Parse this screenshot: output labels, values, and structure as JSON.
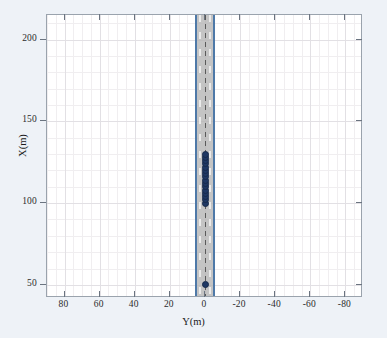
{
  "chart_data": {
    "type": "scatter",
    "title": "",
    "xlabel": "Y(m)",
    "ylabel": "X(m)",
    "xlim": [
      90,
      -90
    ],
    "ylim": [
      42,
      215
    ],
    "x_ticks": [
      80,
      60,
      40,
      20,
      0,
      -20,
      -40,
      -60,
      -80
    ],
    "x_tick_labels": [
      "80",
      "60",
      "40",
      "20",
      "0",
      "-20",
      "-40",
      "-60",
      "-80"
    ],
    "y_ticks": [
      50,
      100,
      150,
      200
    ],
    "y_tick_labels": [
      "50",
      "100",
      "150",
      "200"
    ],
    "x_minor_step": 5,
    "y_minor_step": 10,
    "grid": true,
    "legend": null,
    "x_axis_reversed": true,
    "series": [
      {
        "name": "vehicle-trajectory",
        "marker": "filled-circle",
        "color": "#1f3864",
        "points": [
          {
            "y": 0.0,
            "x": 50.0
          },
          {
            "y": 0.0,
            "x": 100.0
          },
          {
            "y": 0.0,
            "x": 102.0
          },
          {
            "y": 0.0,
            "x": 104.0
          },
          {
            "y": 0.0,
            "x": 106.0
          },
          {
            "y": 0.0,
            "x": 108.0
          },
          {
            "y": 0.0,
            "x": 110.0
          },
          {
            "y": 0.0,
            "x": 112.0
          },
          {
            "y": 0.0,
            "x": 114.0
          },
          {
            "y": 0.0,
            "x": 116.0
          },
          {
            "y": 0.0,
            "x": 118.0
          },
          {
            "y": 0.0,
            "x": 120.0
          },
          {
            "y": 0.0,
            "x": 122.0
          },
          {
            "y": 0.0,
            "x": 124.0
          },
          {
            "y": 0.0,
            "x": 126.0
          },
          {
            "y": 0.0,
            "x": 128.0
          },
          {
            "y": 0.0,
            "x": 130.0
          }
        ]
      }
    ],
    "road": {
      "name": "two-lane-road",
      "center_y": 0,
      "half_width_m": 5.5,
      "fill_color": "#b3b3b3",
      "edge_color": "#4e79a8",
      "center_line_color": "#5a5a5a",
      "lane_marking_color": "#f2f2f2",
      "lane_offsets_m": [
        -2.8,
        2.8
      ]
    },
    "background_color": "#eef2f7",
    "axes_background_color": "#ffffff",
    "grid_color": "#e2e0e4"
  }
}
